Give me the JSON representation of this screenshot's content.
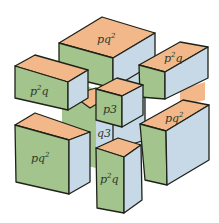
{
  "diagram": {
    "title": "",
    "colors": {
      "top": "#f2b88a",
      "front": "#a3c48d",
      "side": "#c7d9e6",
      "edge": "#1e2218",
      "background": "#ffffff"
    },
    "blocks": [
      {
        "id": "top-pq2",
        "label": "pq",
        "exp": "2",
        "exp_pos": "after"
      },
      {
        "id": "left-p2q",
        "label_pre": "p",
        "exp": "2",
        "label_post": "q"
      },
      {
        "id": "right-p2q",
        "label_pre": "p",
        "exp": "2",
        "label_post": "q"
      },
      {
        "id": "center-p3",
        "label": "p3"
      },
      {
        "id": "back-q3",
        "label": "q3"
      },
      {
        "id": "bottom-left-pq2",
        "label": "pq",
        "exp": "2"
      },
      {
        "id": "bottom-right-pq2",
        "label": "pq",
        "exp": "2"
      },
      {
        "id": "bottom-center-p2q",
        "label_pre": "p",
        "exp": "2",
        "label_post": "q"
      }
    ]
  }
}
